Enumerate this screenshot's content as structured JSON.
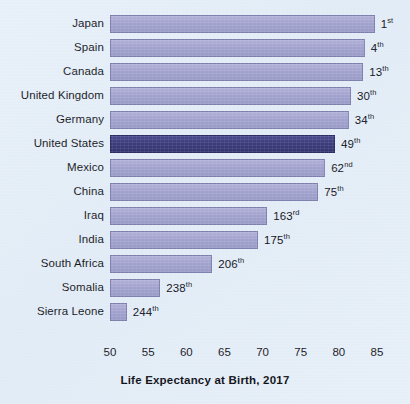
{
  "chart_data": {
    "type": "bar",
    "orientation": "horizontal",
    "title": "Life Expectancy at Birth, 2017",
    "xlabel": "",
    "ylabel": "",
    "xlim": [
      50,
      85
    ],
    "xticks": [
      "50",
      "55",
      "60",
      "65",
      "70",
      "75",
      "80",
      "85"
    ],
    "xtick_values": [
      50,
      55,
      60,
      65,
      70,
      75,
      80,
      85
    ],
    "grid": false,
    "legend": null,
    "categories": [
      "Japan",
      "Spain",
      "Canada",
      "United Kingdom",
      "Germany",
      "United States",
      "Mexico",
      "China",
      "Iraq",
      "India",
      "South Africa",
      "Somalia",
      "Sierra Leone"
    ],
    "values": [
      84.7,
      83.4,
      83.2,
      81.6,
      81.3,
      79.5,
      78.2,
      77.3,
      70.6,
      69.4,
      63.4,
      56.6,
      52.2
    ],
    "annotations": [
      {
        "label": "1",
        "suffix": "st"
      },
      {
        "label": "4",
        "suffix": "th"
      },
      {
        "label": "13",
        "suffix": "th"
      },
      {
        "label": "30",
        "suffix": "th"
      },
      {
        "label": "34",
        "suffix": "th"
      },
      {
        "label": "49",
        "suffix": "th"
      },
      {
        "label": "62",
        "suffix": "nd"
      },
      {
        "label": "75",
        "suffix": "th"
      },
      {
        "label": "163",
        "suffix": "rd"
      },
      {
        "label": "175",
        "suffix": "th"
      },
      {
        "label": "206",
        "suffix": "th"
      },
      {
        "label": "238",
        "suffix": "th"
      },
      {
        "label": "244",
        "suffix": "th"
      }
    ],
    "highlight_category": "United States",
    "colors": {
      "background": "#e4eef8",
      "bar": "#a3a3cf",
      "bar_border": "#7f7fae",
      "bar_highlight": "#3c3c7c",
      "bar_highlight_border": "#2c2c63",
      "text": "#15161c"
    }
  }
}
